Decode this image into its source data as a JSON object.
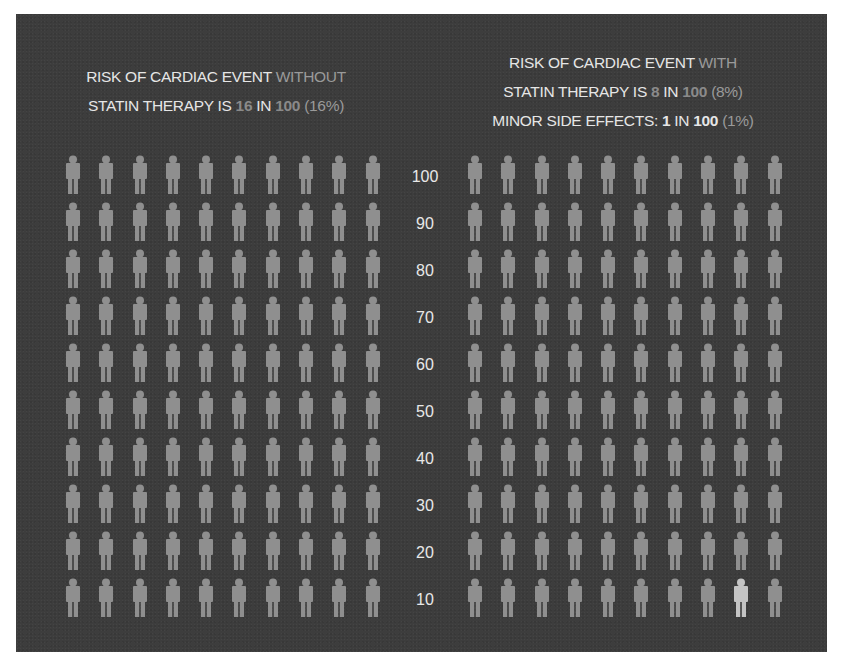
{
  "left_title": {
    "line1_a": "RISK OF CARDIAC EVENT ",
    "line1_b": "WITHOUT",
    "line2_a": "STATIN THERAPY IS ",
    "line2_num": "16",
    "line2_mid": " IN ",
    "line2_total": "100",
    "line2_pct": " (16%)"
  },
  "right_title": {
    "line1_a": "RISK OF CARDIAC EVENT ",
    "line1_b": "WITH",
    "line2_a": "STATIN THERAPY IS ",
    "line2_num": "8",
    "line2_mid": " IN ",
    "line2_total": "100",
    "line2_pct": " (8%)",
    "line3_a": "MINOR SIDE EFFECTS: ",
    "line3_num": "1",
    "line3_mid": " IN ",
    "line3_total": "100",
    "line3_pct": " (1%)"
  },
  "axis_ticks": [
    "100",
    "90",
    "80",
    "70",
    "60",
    "50",
    "40",
    "30",
    "20",
    "10"
  ],
  "colors": {
    "panel": "#3d3d3d",
    "figure": "#8f8f8f",
    "figure_highlight": "#c4c4c4",
    "text": "#e6e6e6"
  },
  "chart_data": {
    "type": "pictograph",
    "panels": [
      {
        "name": "Without statin therapy",
        "grid": [
          10,
          10
        ],
        "total": 100,
        "cardiac_events": 16,
        "percent": 16
      },
      {
        "name": "With statin therapy",
        "grid": [
          10,
          10
        ],
        "total": 100,
        "cardiac_events": 8,
        "percent": 8,
        "minor_side_effects": 1,
        "minor_side_effects_percent": 1,
        "highlighted_figure": {
          "row_label": "10",
          "column": 9
        }
      }
    ],
    "ylabel_ticks": [
      100,
      90,
      80,
      70,
      60,
      50,
      40,
      30,
      20,
      10
    ]
  }
}
